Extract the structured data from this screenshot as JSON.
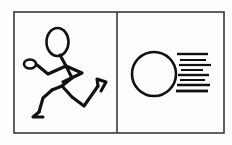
{
  "figure": {
    "background_color": "#fdfdfd",
    "ink_color": "#111111",
    "frame_color": "#3a3a3c",
    "panel_count": 2
  },
  "frame": {
    "name": "outer-rectangle",
    "x": 14,
    "y": 12,
    "width": 210,
    "height": 121,
    "divider_x": 117
  },
  "panels": [
    {
      "index": 1,
      "label": "running-stick-figure",
      "caption": "Stick figure running",
      "bounds": {
        "x": 14,
        "y": 12,
        "width": 103,
        "height": 121
      }
    },
    {
      "index": 2,
      "label": "circle-with-speed-lines",
      "caption": "Circle with motion lines",
      "bounds": {
        "x": 117,
        "y": 12,
        "width": 107,
        "height": 121
      }
    }
  ],
  "stick_figure": {
    "head": {
      "cx": 57.5,
      "cy": 42,
      "rx": 11,
      "ry": 14
    },
    "neck": {
      "x1": 60,
      "y1": 55,
      "x2": 66,
      "y2": 66
    },
    "torso": {
      "points": "66,66 72,78 62,86"
    },
    "left_arm": {
      "points": "66,66 48,74 37,65"
    },
    "left_hand_loop": {
      "cx": 30,
      "cy": 64,
      "rx": 6,
      "ry": 4.5
    },
    "right_arm": {
      "points": "66,66 82,73 63,82"
    },
    "hip": {
      "points": "62,86 52,90"
    },
    "left_leg": {
      "points": "52,90 43,98 39,112"
    },
    "left_foot": {
      "points": "39,112 33,117 43,117"
    },
    "right_leg": {
      "points": "62,86 72,97 84,106 98,86"
    },
    "right_foot": {
      "points": "98,86 97,79 106,82 101,91"
    }
  },
  "motion_graphic": {
    "circle": {
      "cx": 154,
      "cy": 74,
      "r": 22,
      "stroke_width": 2.6
    },
    "speed_lines": [
      {
        "index": 1,
        "x1": 177,
        "x2": 208,
        "y": 54,
        "thickness": 2.4
      },
      {
        "index": 2,
        "x1": 180,
        "x2": 206,
        "y": 60,
        "thickness": 2.0
      },
      {
        "index": 3,
        "x1": 179,
        "x2": 211,
        "y": 65,
        "thickness": 2.2
      },
      {
        "index": 4,
        "x1": 181,
        "x2": 203,
        "y": 70,
        "thickness": 2.0
      },
      {
        "index": 5,
        "x1": 178,
        "x2": 209,
        "y": 75,
        "thickness": 2.4
      },
      {
        "index": 6,
        "x1": 180,
        "x2": 205,
        "y": 80,
        "thickness": 2.0
      },
      {
        "index": 7,
        "x1": 177,
        "x2": 210,
        "y": 85,
        "thickness": 2.4
      },
      {
        "index": 8,
        "x1": 176,
        "x2": 208,
        "y": 91,
        "thickness": 2.8
      }
    ]
  }
}
